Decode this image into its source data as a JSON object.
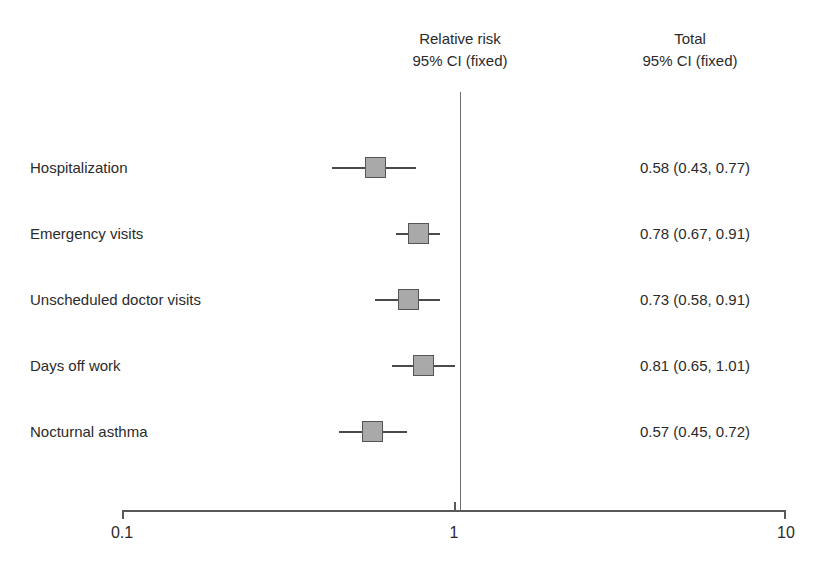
{
  "header": {
    "left_column": {
      "line1": "Relative risk",
      "line2": "95% CI (fixed)"
    },
    "right_column": {
      "line1": "Total",
      "line2": "95% CI (fixed)"
    }
  },
  "axis": {
    "ticks": [
      {
        "label": "0.1",
        "value": 0.1
      },
      {
        "label": "1",
        "value": 1
      },
      {
        "label": "10",
        "value": 10
      }
    ]
  },
  "colors": {
    "marker_fill": "#a9a9a9",
    "marker_border": "#555555",
    "line": "#4a4a4a",
    "axis": "#5a5a5a",
    "text": "#2b2b2b",
    "background": "#ffffff"
  },
  "rows": [
    {
      "label": "Hospitalization",
      "value": "0.58 (0.43, 0.77)",
      "estimate": 0.58,
      "ci_low": 0.43,
      "ci_high": 0.77
    },
    {
      "label": "Emergency visits",
      "value": "0.78 (0.67, 0.91)",
      "estimate": 0.78,
      "ci_low": 0.67,
      "ci_high": 0.91
    },
    {
      "label": "Unscheduled doctor visits",
      "value": "0.73 (0.58, 0.91)",
      "estimate": 0.73,
      "ci_low": 0.58,
      "ci_high": 0.91
    },
    {
      "label": "Days off work",
      "value": "0.81 (0.65, 1.01)",
      "estimate": 0.81,
      "ci_low": 0.65,
      "ci_high": 1.01
    },
    {
      "label": "Nocturnal asthma",
      "value": "0.57 (0.45, 0.72)",
      "estimate": 0.57,
      "ci_low": 0.45,
      "ci_high": 0.72
    }
  ],
  "chart_data": {
    "type": "forest",
    "title": "",
    "xlabel": "",
    "ylabel": "",
    "scale": "log",
    "xlim": [
      0.1,
      10
    ],
    "xticks": [
      0.1,
      1,
      10
    ],
    "xticklabels": [
      "0.1",
      "1",
      "10"
    ],
    "null_line": 1,
    "grid": false,
    "legend": null,
    "effect_measure": "Relative risk",
    "ci_level": "95% CI (fixed)",
    "categories": [
      "Hospitalization",
      "Emergency visits",
      "Unscheduled doctor visits",
      "Days off work",
      "Nocturnal asthma"
    ],
    "estimates": [
      0.58,
      0.78,
      0.73,
      0.81,
      0.57
    ],
    "ci_low": [
      0.43,
      0.67,
      0.58,
      0.65,
      0.45
    ],
    "ci_high": [
      0.77,
      0.91,
      0.91,
      1.01,
      0.72
    ],
    "annotations": [
      "0.58 (0.43, 0.77)",
      "0.78 (0.67, 0.91)",
      "0.73 (0.58, 0.91)",
      "0.81 (0.65, 1.01)",
      "0.57 (0.45, 0.72)"
    ]
  }
}
